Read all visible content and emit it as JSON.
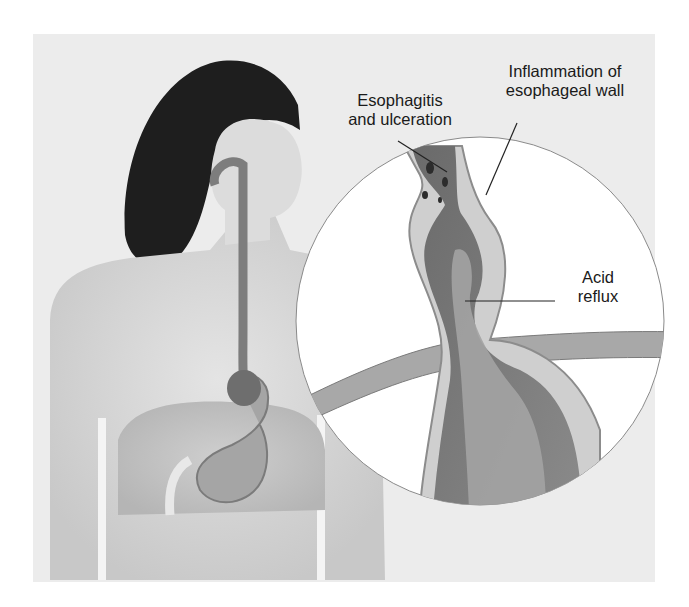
{
  "figure": {
    "labels": {
      "esophagitis": [
        "Esophagitis",
        "and ulceration"
      ],
      "inflammation": [
        "Inflammation of",
        "esophageal wall"
      ],
      "acid_reflux": [
        "Acid",
        "reflux"
      ]
    }
  },
  "colors": {
    "background": "#ececec",
    "skin": "#d9d9d9",
    "hair": "#1e1e1e",
    "tissue_dark": "#4a4a4a",
    "tissue_mid": "#8a8a8a",
    "inset_bg": "#ffffff"
  }
}
